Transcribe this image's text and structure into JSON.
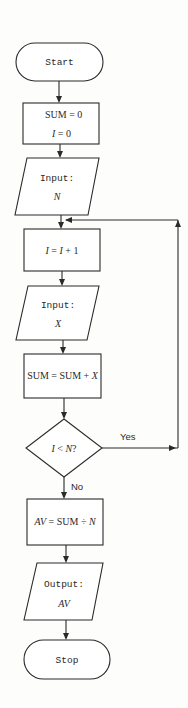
{
  "flowchart": {
    "start": {
      "label": "Start"
    },
    "init": {
      "line1": "SUM = 0",
      "line2_var": "I",
      "line2_rest": " = 0"
    },
    "input_n": {
      "label": "Input:",
      "var": "N"
    },
    "increment": {
      "var1": "I",
      "op": " = ",
      "var2": "I",
      "rest": " + 1"
    },
    "input_x": {
      "label": "Input:",
      "var": "X"
    },
    "accumulate": {
      "text": "SUM = SUM + ",
      "var": "X"
    },
    "decision": {
      "var1": "I",
      "op": " < ",
      "var2": "N",
      "q": "?"
    },
    "decision_yes": "Yes",
    "decision_no": "No",
    "average": {
      "var": "AV",
      "text": " = SUM ÷ ",
      "var2": "N"
    },
    "output_av": {
      "label": "Output:",
      "var": "AV"
    },
    "stop": {
      "label": "Stop"
    }
  },
  "colors": {
    "stroke": "#2a2a2a",
    "fill": "#ffffff",
    "background": "#fdfdfb"
  }
}
